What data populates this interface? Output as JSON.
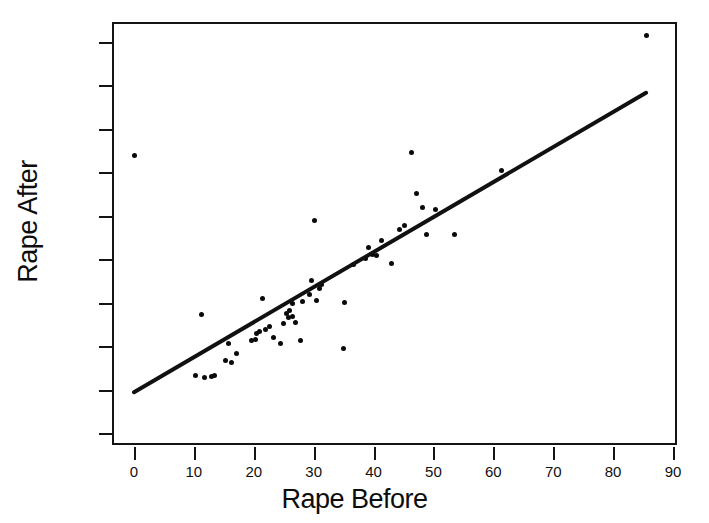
{
  "chart_data": {
    "type": "scatter",
    "title": "",
    "xlabel": "Rape Before",
    "ylabel": "Rape After",
    "xlim": [
      -3,
      93
    ],
    "ylim": [
      -4,
      95
    ],
    "grid": false,
    "legend": "none",
    "xticks": [
      0,
      10,
      20,
      30,
      40,
      50,
      60,
      70,
      80,
      90
    ],
    "yticks": [
      0,
      10,
      20,
      30,
      40,
      50,
      60,
      70,
      80,
      90
    ],
    "xtick_labels": [
      "0",
      "10",
      "20",
      "30",
      "40",
      "50",
      "60",
      "70",
      "80",
      "90"
    ],
    "ytick_labels": [
      "0",
      "10",
      "20",
      "30",
      "40",
      "50",
      "60",
      "70",
      "80",
      "90"
    ],
    "marker_color": "#0a0a0a",
    "line_color": "#111111",
    "frame_color": "#141414",
    "series": [
      {
        "name": "States",
        "points": [
          [
            0.0,
            63.8
          ],
          [
            10.3,
            13.2
          ],
          [
            11.2,
            27.2
          ],
          [
            11.7,
            12.8
          ],
          [
            12.9,
            13.1
          ],
          [
            13.4,
            13.2
          ],
          [
            15.2,
            16.6
          ],
          [
            15.8,
            20.6
          ],
          [
            16.3,
            16.2
          ],
          [
            17.1,
            18.4
          ],
          [
            19.6,
            21.3
          ],
          [
            20.3,
            21.5
          ],
          [
            20.5,
            22.9
          ],
          [
            21.0,
            23.3
          ],
          [
            21.4,
            31.0
          ],
          [
            21.9,
            23.8
          ],
          [
            22.6,
            24.6
          ],
          [
            23.3,
            21.9
          ],
          [
            24.4,
            20.5
          ],
          [
            24.9,
            25.2
          ],
          [
            25.5,
            27.4
          ],
          [
            25.8,
            26.6
          ],
          [
            25.9,
            28.3
          ],
          [
            26.4,
            26.9
          ],
          [
            26.5,
            29.8
          ],
          [
            26.9,
            25.4
          ],
          [
            27.8,
            21.2
          ],
          [
            28.2,
            30.2
          ],
          [
            29.3,
            31.9
          ],
          [
            29.6,
            35.1
          ],
          [
            30.1,
            48.8
          ],
          [
            30.4,
            30.4
          ],
          [
            31.0,
            33.2
          ],
          [
            31.3,
            34.2
          ],
          [
            34.9,
            19.5
          ],
          [
            35.1,
            30.1
          ],
          [
            36.6,
            38.7
          ],
          [
            38.7,
            40.2
          ],
          [
            39.2,
            42.8
          ],
          [
            39.8,
            41.2
          ],
          [
            40.5,
            40.9
          ],
          [
            41.3,
            44.4
          ],
          [
            43.0,
            39.1
          ],
          [
            44.3,
            46.9
          ],
          [
            45.2,
            47.8
          ],
          [
            46.3,
            64.5
          ],
          [
            47.1,
            55.1
          ],
          [
            48.1,
            51.9
          ],
          [
            48.9,
            45.8
          ],
          [
            50.4,
            51.5
          ],
          [
            53.5,
            45.8
          ],
          [
            61.4,
            60.5
          ],
          [
            85.5,
            91.5
          ]
        ]
      }
    ],
    "fit_line": {
      "name": "least-squares fit",
      "x0": 0.0,
      "y0": 9.4,
      "x1": 85.5,
      "y1": 78.3,
      "slope": 0.806,
      "intercept": 9.4
    }
  }
}
